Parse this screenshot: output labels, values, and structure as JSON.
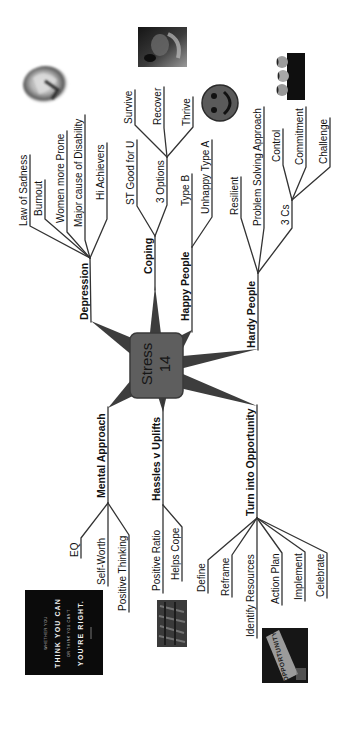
{
  "central_node": {
    "title": "Stress",
    "number": "14"
  },
  "branches": {
    "depression": {
      "label": "Depression",
      "items": [
        "Law of Sadness",
        "Burnout",
        "Women more Prone",
        "Major cause of Disability",
        "Hi Achievers"
      ]
    },
    "coping": {
      "label": "Coping",
      "items": [
        "ST Good for U",
        "3 Options"
      ],
      "three_options": [
        "Survive",
        "Recover",
        "Thrive"
      ]
    },
    "happy_people": {
      "label": "Happy People",
      "items": [
        "Type B",
        "Unhappy Type A"
      ]
    },
    "hardy_people": {
      "label": "Hardy People",
      "items": [
        "Resilient",
        "Problem Solving Approach",
        "3 Cs"
      ],
      "three_cs": [
        "Control",
        "Commitment",
        "Challenge"
      ]
    },
    "mental_approach": {
      "label": "Mental Approach",
      "items": [
        "EQ",
        "Self-Worth",
        "Positive Thinking"
      ]
    },
    "hassles_v_uplifts": {
      "label": "Hassles v Uplifts",
      "items": [
        "Positive Ratio",
        "Helps Cope"
      ]
    },
    "turn_into_opportunity": {
      "label": "Turn into Opportunity",
      "items": [
        "Define",
        "Reframe",
        "Identify Resources",
        "Action Plan",
        "Implement",
        "Celebrate"
      ]
    }
  },
  "images": {
    "poster": {
      "lines": [
        "WHETHER YOU",
        "THINK YOU CAN",
        "OR THINK YOU CAN'T",
        "YOU'RE RIGHT."
      ]
    },
    "opportunity_sign": {
      "text": "OPPORTUNITY"
    },
    "pictures": [
      "hands-photo",
      "face-in-hands-photo",
      "smiley-face-icon",
      "group-photo",
      "crowd-photo",
      "poster-photo",
      "opportunity-sign-photo"
    ]
  },
  "colors": {
    "background": "#ffffff",
    "node_fill": "#5e5e5e",
    "node_stroke": "#3a3a3a",
    "connector": "#3d3d3d",
    "line": "#333333",
    "text": "#111111"
  }
}
